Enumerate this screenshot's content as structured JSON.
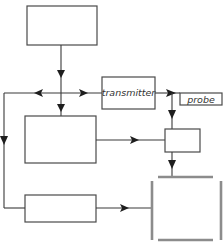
{
  "diagram": {
    "type": "block-diagram",
    "nodes": {
      "top_box": {
        "label": ""
      },
      "transmitter": {
        "label": "transmitter"
      },
      "probe": {
        "label": "probe"
      },
      "middle_box": {
        "label": ""
      },
      "small_box": {
        "label": ""
      },
      "bottom_box": {
        "label": ""
      },
      "container": {
        "label": ""
      }
    },
    "edges": [
      {
        "from": "top_box",
        "to": "junction"
      },
      {
        "from": "junction",
        "to": "transmitter"
      },
      {
        "from": "junction",
        "to": "left_bus"
      },
      {
        "from": "junction",
        "to": "middle_box"
      },
      {
        "from": "transmitter",
        "to": "probe"
      },
      {
        "from": "probe",
        "to": "small_box"
      },
      {
        "from": "middle_box",
        "to": "small_box"
      },
      {
        "from": "small_box",
        "to": "container"
      },
      {
        "from": "left_bus",
        "to": "bottom_box"
      },
      {
        "from": "bottom_box",
        "to": "container"
      }
    ],
    "colors": {
      "box_stroke": "#4a4a4a",
      "line": "#3a3a3a",
      "arrow": "#1e1e1e",
      "container_bar": "#8c8c8c"
    }
  }
}
